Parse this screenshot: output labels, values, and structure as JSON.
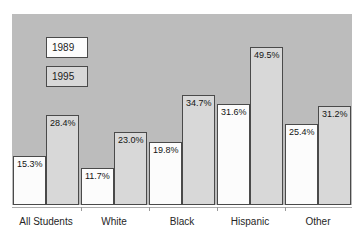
{
  "title_fragment": "1989 and 1995",
  "chart_data": {
    "type": "bar",
    "title": "1989 and 1995",
    "title_note": "title line clipped at top edge of image; only bottom of glyphs visible",
    "categories": [
      "All Students",
      "White",
      "Black",
      "Hispanic",
      "Other"
    ],
    "series": [
      {
        "name": "1989",
        "values": [
          15.3,
          11.7,
          19.8,
          31.6,
          25.4
        ]
      },
      {
        "name": "1995",
        "values": [
          28.4,
          23.0,
          34.7,
          49.5,
          31.2
        ]
      }
    ],
    "value_labels": [
      [
        "15.3%",
        "11.7%",
        "19.8%",
        "31.6%",
        "25.4%"
      ],
      [
        "28.4%",
        "23.0%",
        "34.7%",
        "49.5%",
        "31.2%"
      ]
    ],
    "xlabel": "",
    "ylabel": "",
    "ylim": [
      0,
      60
    ],
    "grid": false,
    "legend_position": "inside-top-left",
    "colors": {
      "plot_background": "#bcbcbc",
      "series_1989_fill": "#fcfcfc",
      "series_1995_fill": "#d8d8d8",
      "bar_border": "#4a4a4a",
      "axis_line": "#adadad",
      "text": "#1c1c1c"
    }
  }
}
